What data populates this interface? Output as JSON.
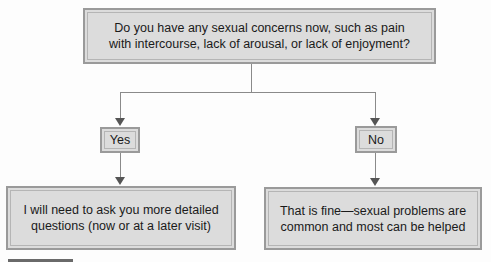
{
  "diagram": {
    "question": "Do you have any sexual concerns now, such as pain\nwith intercourse, lack of arousal, or lack of enjoyment?",
    "branches": [
      {
        "label": "Yes",
        "outcome": "I will need to ask you more detailed\nquestions (now or at a later visit)"
      },
      {
        "label": "No",
        "outcome": "That is fine—sexual problems are\ncommon and most can be helped"
      }
    ]
  },
  "colors": {
    "box_fill": "#dcdcdc",
    "box_border": "#9a9a9a",
    "connector": "#8a8a8a",
    "arrowhead": "#555555"
  }
}
